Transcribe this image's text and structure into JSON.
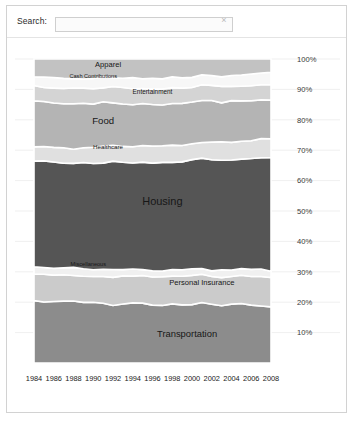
{
  "search": {
    "label": "Search:",
    "value": "",
    "placeholder": "",
    "clear_icon": "×"
  },
  "chart_data": {
    "type": "area",
    "stacked": true,
    "normalized": true,
    "title": "",
    "xlabel": "",
    "ylabel": "",
    "grid": true,
    "legend_position": "inline-labels",
    "ylim": [
      0,
      100
    ],
    "y_ticks": [
      "10%",
      "20%",
      "30%",
      "40%",
      "50%",
      "60%",
      "70%",
      "80%",
      "90%",
      "100%"
    ],
    "y_tick_values": [
      10,
      20,
      30,
      40,
      50,
      60,
      70,
      80,
      90,
      100
    ],
    "x_ticks": [
      "1984",
      "1986",
      "1988",
      "1990",
      "1992",
      "1994",
      "1996",
      "1998",
      "2000",
      "2002",
      "2004",
      "2006",
      "2008"
    ],
    "x": [
      1984,
      1985,
      1986,
      1987,
      1988,
      1989,
      1990,
      1991,
      1992,
      1993,
      1994,
      1995,
      1996,
      1997,
      1998,
      1999,
      2000,
      2001,
      2002,
      2003,
      2004,
      2005,
      2006,
      2007,
      2008
    ],
    "xlim": [
      1984,
      2008
    ],
    "series": [
      {
        "name": "Transportation",
        "color": "#8c8c8c",
        "label_x": 1999.5,
        "label_y": 8.5,
        "label_size": 9.4,
        "values": [
          20.6,
          20.2,
          20.0,
          20.3,
          20.6,
          20.1,
          19.8,
          19.5,
          19.2,
          19.6,
          19.9,
          19.5,
          19.2,
          19.0,
          19.4,
          19.1,
          19.3,
          19.6,
          19.3,
          19.0,
          19.2,
          19.6,
          19.3,
          18.9,
          18.5
        ]
      },
      {
        "name": "Personal Insurance",
        "color": "#cbcbcb",
        "label_x": 2001.0,
        "label_y": 25.5,
        "label_size": 7.6,
        "values": [
          8.6,
          8.8,
          8.9,
          8.5,
          8.3,
          8.6,
          8.9,
          9.0,
          9.2,
          9.0,
          8.8,
          9.0,
          9.2,
          9.4,
          9.2,
          9.3,
          9.5,
          9.3,
          9.1,
          9.3,
          9.5,
          9.2,
          9.4,
          9.6,
          9.8
        ]
      },
      {
        "name": "Miscellaneous",
        "color": "#f0f0f0",
        "label_x": 1989.5,
        "label_y": 31.8,
        "label_size": 5.6,
        "values": [
          2.4,
          2.3,
          2.2,
          2.4,
          2.3,
          2.2,
          2.1,
          2.2,
          2.3,
          2.2,
          2.1,
          2.2,
          2.1,
          2.0,
          2.1,
          2.2,
          2.1,
          2.0,
          2.1,
          2.2,
          2.1,
          2.0,
          2.1,
          2.2,
          2.1
        ]
      },
      {
        "name": "Housing",
        "color": "#555555",
        "label_x": 1997.0,
        "label_y": 52.0,
        "label_size": 11.0,
        "values": [
          35.0,
          35.2,
          35.0,
          34.7,
          34.5,
          34.8,
          35.0,
          35.3,
          35.5,
          35.2,
          35.0,
          35.3,
          35.5,
          35.8,
          35.5,
          35.8,
          36.0,
          36.3,
          36.6,
          36.3,
          36.0,
          36.3,
          36.6,
          37.0,
          37.4
        ]
      },
      {
        "name": "Healthcare",
        "color": "#e0e0e0",
        "label_x": 1991.5,
        "label_y": 70.5,
        "label_size": 6.2,
        "values": [
          4.6,
          4.7,
          4.8,
          4.7,
          4.9,
          5.0,
          5.1,
          5.2,
          5.4,
          5.3,
          5.2,
          5.3,
          5.4,
          5.3,
          5.5,
          5.4,
          5.3,
          5.5,
          5.6,
          5.8,
          5.9,
          5.8,
          5.9,
          6.0,
          6.1
        ]
      },
      {
        "name": "Food",
        "color": "#b4b4b4",
        "label_x": 1991.0,
        "label_y": 78.5,
        "label_size": 9.6,
        "values": [
          15.0,
          14.8,
          14.6,
          14.9,
          14.7,
          14.5,
          14.3,
          14.5,
          14.2,
          14.0,
          14.2,
          14.0,
          13.8,
          13.6,
          13.8,
          13.6,
          13.4,
          13.6,
          13.4,
          13.2,
          13.4,
          13.2,
          13.0,
          12.9,
          12.8
        ]
      },
      {
        "name": "Entertainment",
        "color": "#d4d4d4",
        "label_x": 1996.0,
        "label_y": 88.5,
        "label_size": 6.4,
        "values": [
          4.8,
          4.9,
          5.0,
          4.9,
          5.1,
          5.0,
          4.9,
          5.0,
          5.1,
          5.2,
          5.1,
          5.0,
          5.1,
          5.2,
          5.1,
          5.2,
          5.1,
          5.0,
          5.1,
          5.2,
          5.1,
          5.0,
          5.1,
          5.2,
          5.1
        ]
      },
      {
        "name": "Cash Contributions",
        "color": "#f7f7f7",
        "label_x": 1990.0,
        "label_y": 93.6,
        "label_size": 5.6,
        "values": [
          3.0,
          3.1,
          3.2,
          3.1,
          3.0,
          3.2,
          3.3,
          3.2,
          3.1,
          3.3,
          3.4,
          3.3,
          3.2,
          3.4,
          3.3,
          3.2,
          3.4,
          3.5,
          3.4,
          3.3,
          3.5,
          3.6,
          3.5,
          3.4,
          3.6
        ]
      },
      {
        "name": "Apparel",
        "color": "#c2c2c2",
        "label_x": 1991.5,
        "label_y": 97.5,
        "label_size": 7.6,
        "values": [
          6.0,
          6.0,
          6.3,
          6.5,
          6.6,
          6.6,
          6.6,
          6.1,
          6.0,
          6.2,
          6.3,
          6.4,
          6.5,
          6.3,
          6.1,
          6.2,
          5.9,
          5.2,
          5.4,
          5.7,
          5.3,
          5.3,
          5.1,
          4.8,
          4.6
        ]
      }
    ]
  }
}
